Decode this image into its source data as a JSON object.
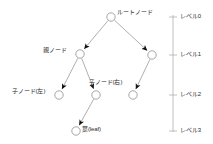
{
  "diagram": {
    "colors": {
      "edge": "#9a9a9a",
      "node_stroke": "#8f8f8f",
      "node_fill": "#ffffff",
      "arrow": "#111111",
      "axis": "#b0b0b0",
      "text": "#2a2a2a"
    },
    "nodes": [
      {
        "id": "root",
        "label": "ルートノード",
        "label_side": "right",
        "cx": 111,
        "cy": 17,
        "r": 4.2,
        "level": 0
      },
      {
        "id": "n1l",
        "label": "親ノード",
        "label_side": "left",
        "cx": 80,
        "cy": 54,
        "r": 4.2,
        "level": 1
      },
      {
        "id": "n1r",
        "label": "",
        "label_side": "none",
        "cx": 152,
        "cy": 55,
        "r": 4.2,
        "level": 1
      },
      {
        "id": "n2a",
        "label": "子ノード(左)",
        "label_side": "left",
        "cx": 59,
        "cy": 95,
        "r": 4.2,
        "level": 2
      },
      {
        "id": "n2b",
        "label": "子ノード(右)",
        "label_side": "upleft",
        "cx": 96,
        "cy": 95,
        "r": 4.2,
        "level": 2
      },
      {
        "id": "n2c",
        "label": "",
        "label_side": "none",
        "cx": 133,
        "cy": 95,
        "r": 4.2,
        "level": 2
      },
      {
        "id": "leaf",
        "label": "葉(leaf)",
        "label_side": "right",
        "cx": 76,
        "cy": 131,
        "r": 4.2,
        "level": 3
      }
    ],
    "edges": [
      {
        "from": "root",
        "to": "n1l"
      },
      {
        "from": "root",
        "to": "n1r"
      },
      {
        "from": "n1l",
        "to": "n2a"
      },
      {
        "from": "n1l",
        "to": "n2b"
      },
      {
        "from": "n1r",
        "to": "n2c"
      },
      {
        "from": "n2b",
        "to": "leaf"
      }
    ],
    "labels": {
      "root": "ルートノード",
      "parent": "親ノード",
      "child_left": "子ノード(左)",
      "child_right": "子ノード(右)",
      "leaf": "葉(leaf)"
    },
    "level_axis": {
      "x": 173,
      "top": 15,
      "bottom": 132,
      "tick_len": 4,
      "ticks": [
        {
          "label": "レベル0",
          "y": 17
        },
        {
          "label": "レベル1",
          "y": 55
        },
        {
          "label": "レベル2",
          "y": 95
        },
        {
          "label": "レベル3",
          "y": 131
        }
      ]
    }
  }
}
